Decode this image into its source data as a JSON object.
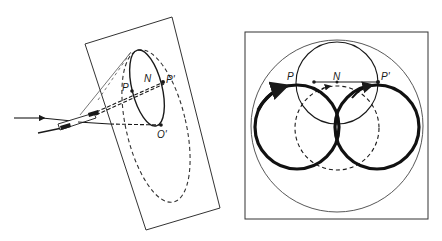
{
  "figure": {
    "left_panel": {
      "description": "Oblique view of beam striking a tilted plane with elliptical traces",
      "labels": {
        "p": "P",
        "n": "N",
        "p_prime": "P'",
        "o_prime": "O'"
      }
    },
    "right_panel": {
      "description": "Plan view showing circles and the P–P' chord through N",
      "labels": {
        "p": "P",
        "n": "N",
        "p_prime": "P'"
      }
    },
    "colors": {
      "ink": "#1a1a1a",
      "thin_line": "#444444",
      "background": "#ffffff"
    }
  }
}
